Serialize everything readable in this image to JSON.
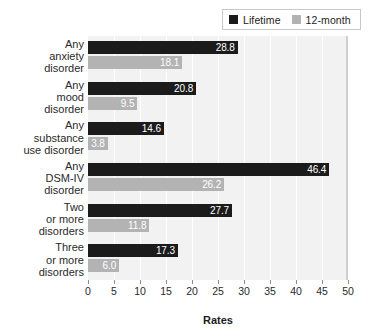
{
  "chart_data": {
    "type": "bar",
    "orientation": "horizontal",
    "title": "",
    "xlabel": "Rates",
    "ylabel": "",
    "xlim": [
      0,
      50
    ],
    "xticks": [
      0,
      5,
      10,
      15,
      20,
      25,
      30,
      35,
      40,
      45,
      50
    ],
    "grid": true,
    "legend_position": "top-right",
    "categories": [
      "Any\nanxiety\ndisorder",
      "Any\nmood\ndisorder",
      "Any\nsubstance\nuse disorder",
      "Any\nDSM-IV\ndisorder",
      "Two\nor more\ndisorders",
      "Three\nor more\ndisorders"
    ],
    "category_lines": [
      [
        "Any",
        "anxiety",
        "disorder"
      ],
      [
        "Any",
        "mood",
        "disorder"
      ],
      [
        "Any",
        "substance",
        "use disorder"
      ],
      [
        "Any",
        "DSM-IV",
        "disorder"
      ],
      [
        "Two",
        "or more",
        "disorders"
      ],
      [
        "Three",
        "or more",
        "disorders"
      ]
    ],
    "series": [
      {
        "name": "Lifetime",
        "color": "#1b1b1b",
        "values": [
          28.8,
          20.8,
          14.6,
          46.4,
          27.7,
          17.3
        ],
        "labels": [
          "28.8",
          "20.8",
          "14.6",
          "46.4",
          "27.7",
          "17.3"
        ]
      },
      {
        "name": "12-month",
        "color": "#b3b3b3",
        "values": [
          18.1,
          9.5,
          3.8,
          26.2,
          11.8,
          6.0
        ],
        "labels": [
          "18.1",
          "9.5",
          "3.8",
          "26.2",
          "11.8",
          "6.0"
        ]
      }
    ]
  },
  "legend": {
    "entries": [
      {
        "label": "Lifetime",
        "color": "#1b1b1b"
      },
      {
        "label": "12-month",
        "color": "#b3b3b3"
      }
    ]
  },
  "axis": {
    "x_title": "Rates",
    "x_tick_labels": [
      "0",
      "5",
      "10",
      "15",
      "20",
      "25",
      "30",
      "35",
      "40",
      "45",
      "50"
    ]
  },
  "colors": {
    "lifetime": "#1b1b1b",
    "twelve_month": "#b3b3b3",
    "plot_background": "#f2f2f2",
    "gridline": "#ffffff"
  }
}
